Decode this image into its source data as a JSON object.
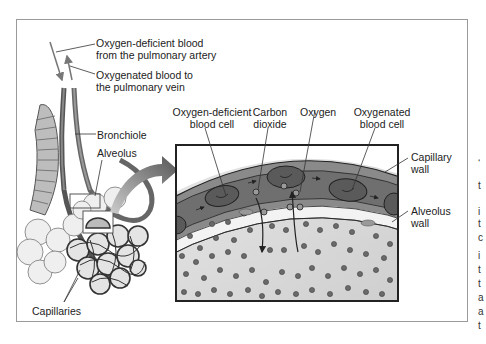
{
  "figure": {
    "labels": {
      "artery_line1": "Oxygen-deficient blood",
      "artery_line2": "from the pulmonary artery",
      "vein_line1": "Oxygenated blood to",
      "vein_line2": "the pulmonary vein",
      "bronchiole": "Bronchiole",
      "alveolus": "Alveolus",
      "capillaries": "Capillaries",
      "deficient_cell_line1": "Oxygen-deficient",
      "deficient_cell_line2": "blood cell",
      "co2_line1": "Carbon",
      "co2_line2": "dioxide",
      "oxygen": "Oxygen",
      "oxygenated_cell_line1": "Oxygenated",
      "oxygenated_cell_line2": "blood cell",
      "capillary_wall_line1": "Capillary",
      "capillary_wall_line2": "wall",
      "alveolus_wall_line1": "Alveolus",
      "alveolus_wall_line2": "wall"
    },
    "colors": {
      "frame_border": "#9a9a9a",
      "capillary_blood": "#6f6f6f",
      "capillary_wall": "#9c9c9c",
      "blood_cell": "#5a5a5a",
      "alveolus_air": "#d8d8d8",
      "particle": "#6a6a6a",
      "arrow": "#555555"
    }
  },
  "edge_glyphs": [
    "‘",
    "t",
    "i",
    "t",
    "c",
    "i",
    "t",
    "t",
    "a",
    "a",
    "t"
  ]
}
